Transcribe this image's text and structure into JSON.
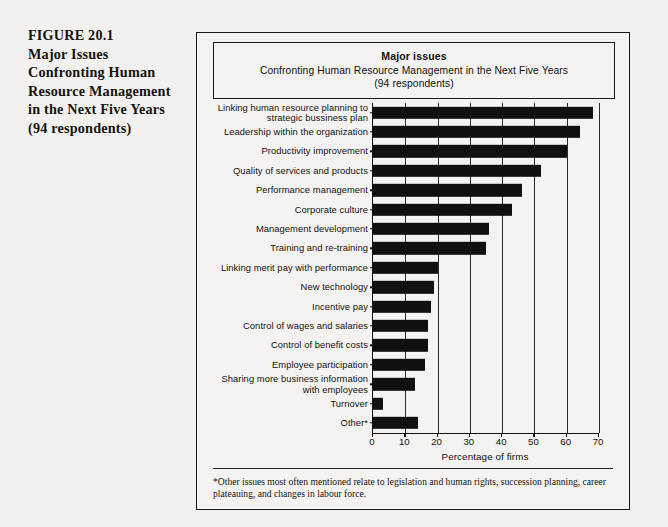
{
  "figure": {
    "caption_lines": [
      "FIGURE 20.1",
      "Major Issues",
      "Confronting Human",
      "Resource Management",
      "in the Next Five Years",
      "(94 respondents)"
    ]
  },
  "chart_title": {
    "main": "Major issues",
    "subtitle": "Confronting Human Resource Management in the Next Five Years",
    "respondents": "(94 respondents)"
  },
  "footnote": "*Other issues most often mentioned relate to legislation and human rights, succession planning, career plateauing, and changes in labour force.",
  "colors": {
    "bar": "#101010",
    "page_background": "#f2f1ef",
    "frame_background": "#f4f3f1",
    "frame_border": "#1a1a1a",
    "gridline": "#2b2b2b"
  },
  "chart_data": {
    "type": "bar",
    "orientation": "horizontal",
    "title": "Major issues",
    "subtitle": "Confronting Human Resource Management in the Next Five Years",
    "xlabel": "Percentage of firms",
    "ylabel": "",
    "xlim": [
      0,
      70
    ],
    "xticks": [
      0,
      10,
      20,
      30,
      40,
      50,
      60,
      70
    ],
    "grid": "vertical",
    "legend": "none",
    "categories": [
      "Linking human resource planning to\nstrategic bussiness plan",
      "Leadership within the organization",
      "Productivity improvement",
      "Quality of services and products",
      "Performance management",
      "Corporate culture",
      "Management development",
      "Training and re-training",
      "Linking merit pay with performance",
      "New technology",
      "Incentive pay",
      "Control of wages and salaries",
      "Control of benefit costs",
      "Employee participation",
      "Sharing more business information\nwith employees",
      "Turnover",
      "Other*"
    ],
    "values": [
      68,
      64,
      60,
      52,
      46,
      43,
      36,
      35,
      20,
      19,
      18,
      17,
      17,
      16,
      13,
      3,
      14
    ]
  }
}
